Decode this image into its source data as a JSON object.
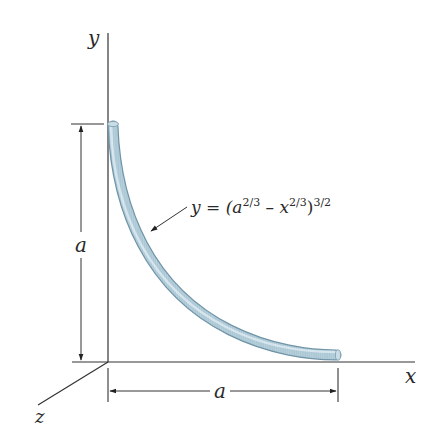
{
  "figure": {
    "axes": {
      "x_label": "x",
      "y_label": "y",
      "z_label": "z"
    },
    "dimensions": {
      "vertical_label": "a",
      "horizontal_label": "a"
    },
    "curve": {
      "equation_prefix": "y = (a",
      "exp1": "2/3",
      "minus_x": " – x",
      "exp2": "2/3",
      "close": ")",
      "exp3": "3/2",
      "rod_color": "#9fc0d0",
      "rod_highlight": "#d8e8ef",
      "rod_shadow": "#6f93a6"
    },
    "line_color": "#333333"
  }
}
